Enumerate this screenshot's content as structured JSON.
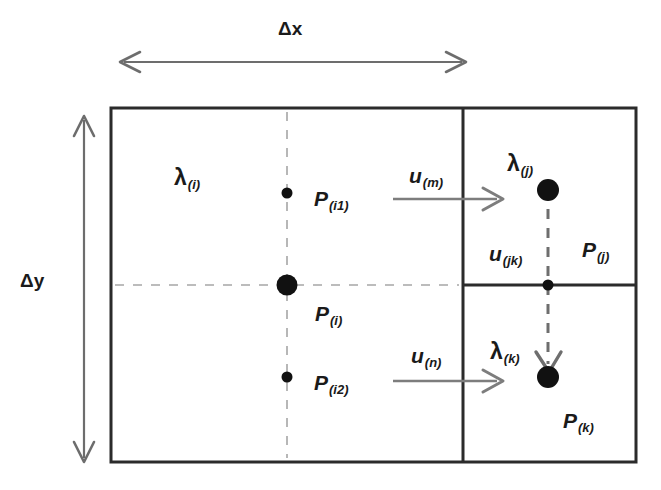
{
  "figure": {
    "type": "diagram",
    "colors": {
      "ink": "#1a1a1a",
      "cell_border": "#2b2b2b",
      "dashed_guide": "#9a9a9a",
      "dashed_link": "#6e6e6e",
      "arrow_gray": "#7d7d7d",
      "background": "#ffffff"
    }
  },
  "dimensions": {
    "x": {
      "delta": "Δ",
      "symbol": "x",
      "label": "Δx",
      "arrow": "double-headed-horizontal"
    },
    "y": {
      "delta": "Δ",
      "symbol": "y",
      "label": "Δy",
      "arrow": "double-headed-vertical"
    }
  },
  "cells": {
    "left": {
      "name": "cell-i",
      "lambda": {
        "base": "λ",
        "sub": "(i)"
      },
      "pressure": {
        "base": "P",
        "sub": "(i)"
      }
    },
    "top_right": {
      "name": "cell-j",
      "lambda": {
        "base": "λ",
        "sub": "(j)"
      },
      "pressure": {
        "base": "P",
        "sub": "(j)"
      }
    },
    "bottom_right": {
      "name": "cell-k",
      "lambda": {
        "base": "λ",
        "sub": "(k)"
      },
      "pressure": {
        "base": "P",
        "sub": "(k)"
      }
    }
  },
  "nodes": {
    "p_i1": {
      "base": "P",
      "sub": "(i1)"
    },
    "p_i2": {
      "base": "P",
      "sub": "(i2)"
    }
  },
  "velocities": {
    "u_m": {
      "base": "u",
      "sub": "(m)"
    },
    "u_n": {
      "base": "u",
      "sub": "(n)"
    },
    "u_jk": {
      "base": "u",
      "sub": "(jk)"
    }
  },
  "geometry": {
    "outer_box": {
      "x": 111,
      "y": 108,
      "width": 525,
      "height": 354
    },
    "vertical_divider_x": 463,
    "horizontal_divider_y": 285,
    "left_dashed_vertical_x": 287,
    "left_dashed_horizontal_y": 285,
    "right_dashed_vertical_x": 548,
    "dots": [
      {
        "name": "dot-p-i1",
        "cx": 287,
        "cy": 193,
        "r": 5
      },
      {
        "name": "dot-p-i",
        "cx": 287,
        "cy": 285,
        "r": 10
      },
      {
        "name": "dot-p-i2",
        "cx": 287,
        "cy": 377,
        "r": 5
      },
      {
        "name": "dot-p-j",
        "cx": 548,
        "cy": 190,
        "r": 11
      },
      {
        "name": "dot-u-jk",
        "cx": 548,
        "cy": 285,
        "r": 5
      },
      {
        "name": "dot-p-k",
        "cx": 548,
        "cy": 377,
        "r": 11
      }
    ],
    "flow_arrows": [
      {
        "name": "arrow-u-m",
        "x1": 393,
        "y1": 199,
        "x2": 502,
        "y2": 199
      },
      {
        "name": "arrow-u-n",
        "x1": 393,
        "y1": 381,
        "x2": 502,
        "y2": 381
      }
    ]
  }
}
